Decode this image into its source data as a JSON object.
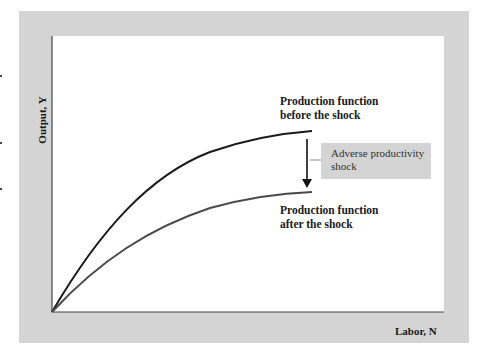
{
  "diagram": {
    "y_axis_label": "Output, Y",
    "x_axis_label": "Labor, N",
    "curves": [
      {
        "name": "before",
        "label_line1": "Production function",
        "label_line2": "before the shock",
        "color": "#1a1a1a"
      },
      {
        "name": "after",
        "label_line1": "Production function",
        "label_line2": "after the shock",
        "color": "#4a4a4a"
      }
    ],
    "shock_label_line1": "Adverse productivity",
    "shock_label_line2": "shock",
    "colors": {
      "panel": "#d4d4d4",
      "plot": "#ffffff",
      "axis": "#444444"
    }
  }
}
